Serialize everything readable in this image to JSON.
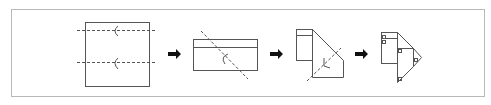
{
  "diagram": {
    "stroke_color": "#555555",
    "frame_color": "#b8b8b8",
    "arrow_color": "#111111",
    "steps": [
      {
        "id": "step-1",
        "description": "Square sheet with two horizontal dashed fold lines and fold-direction marks"
      },
      {
        "id": "step-2",
        "description": "Folded rectangle with diagonal dashed fold line and fold mark"
      },
      {
        "id": "step-3",
        "description": "Pentagon-like shape with diagonal dashed fold line and fold mark"
      },
      {
        "id": "step-4",
        "description": "Final folded shape with small square markers"
      }
    ],
    "arrows": [
      {
        "id": "arrow-1",
        "direction": "right"
      },
      {
        "id": "arrow-2",
        "direction": "right"
      },
      {
        "id": "arrow-3",
        "direction": "right"
      }
    ]
  }
}
